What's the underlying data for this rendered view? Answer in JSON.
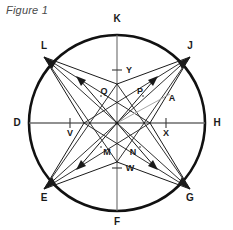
{
  "figure": {
    "caption": "Figure 1",
    "geometry": {
      "center_x": 117,
      "center_y": 123,
      "radius": 88,
      "circle_stroke": "#111111",
      "circle_stroke_width": 2.6,
      "axis_stroke": "#6b6b6b",
      "axis_stroke_width": 1.3,
      "star_stroke": "#1a1a1a",
      "star_stroke_width": 1.0,
      "accent_stroke": "#9a9a9a"
    },
    "circle_points": [
      {
        "id": "K",
        "label": "K",
        "angle_deg": 90,
        "label_x": 117,
        "label_y": 19
      },
      {
        "id": "J",
        "label": "J",
        "angle_deg": 50,
        "label_x": 190,
        "label_y": 46
      },
      {
        "id": "H",
        "label": "H",
        "angle_deg": 0,
        "label_x": 217,
        "label_y": 123
      },
      {
        "id": "G",
        "label": "G",
        "angle_deg": -50,
        "label_x": 190,
        "label_y": 198
      },
      {
        "id": "F",
        "label": "F",
        "angle_deg": -90,
        "label_x": 117,
        "label_y": 222
      },
      {
        "id": "E",
        "label": "E",
        "angle_deg": -130,
        "label_x": 44,
        "label_y": 198
      },
      {
        "id": "D",
        "label": "D",
        "angle_deg": 180,
        "label_x": 17,
        "label_y": 123
      },
      {
        "id": "L",
        "label": "L",
        "angle_deg": 130,
        "label_x": 44,
        "label_y": 46
      }
    ],
    "axis_ticks": [
      {
        "id": "Y",
        "label": "Y",
        "axis": "vertical",
        "offset": -53,
        "label_x": 129,
        "label_y": 70
      },
      {
        "id": "W",
        "label": "W",
        "axis": "vertical",
        "offset": 46,
        "label_x": 130,
        "label_y": 168
      },
      {
        "id": "V",
        "label": "V",
        "axis": "horizontal",
        "offset": -48,
        "label_x": 70,
        "label_y": 133
      },
      {
        "id": "X",
        "label": "X",
        "axis": "horizontal",
        "offset": 48,
        "label_x": 166,
        "label_y": 133
      }
    ],
    "interior_labels": [
      {
        "id": "Q",
        "label": "Q",
        "label_x": 104,
        "label_y": 91
      },
      {
        "id": "P",
        "label": "P",
        "label_x": 140,
        "label_y": 91
      },
      {
        "id": "M",
        "label": "M",
        "label_x": 107,
        "label_y": 152
      },
      {
        "id": "N",
        "label": "N",
        "label_x": 133,
        "label_y": 152
      },
      {
        "id": "A",
        "label": "A",
        "label_x": 172,
        "label_y": 98
      }
    ],
    "star_vertices": [
      {
        "id": "L-tip",
        "x": 44,
        "y": 57
      },
      {
        "id": "J-tip",
        "x": 190,
        "y": 57
      },
      {
        "id": "E-tip",
        "x": 44,
        "y": 189
      },
      {
        "id": "G-tip",
        "x": 190,
        "y": 189
      }
    ],
    "star_inner_points": [
      {
        "id": "top",
        "x": 117,
        "y": 84
      },
      {
        "id": "right",
        "x": 150,
        "y": 123
      },
      {
        "id": "bottom",
        "x": 117,
        "y": 162
      },
      {
        "id": "left",
        "x": 84,
        "y": 123
      }
    ],
    "arrow_targets": [
      {
        "id": "arrow-to-L",
        "x": 76,
        "y": 78
      },
      {
        "id": "arrow-to-J",
        "x": 158,
        "y": 78
      },
      {
        "id": "arrow-to-E",
        "x": 76,
        "y": 168
      },
      {
        "id": "arrow-to-G",
        "x": 158,
        "y": 168
      }
    ]
  }
}
